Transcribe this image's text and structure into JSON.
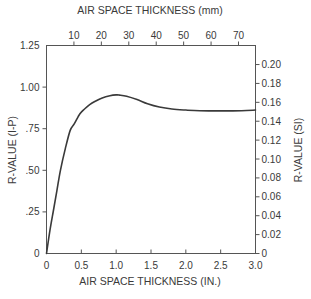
{
  "chart_data": {
    "type": "line",
    "title": "",
    "xlabel": "AIR SPACE THICKNESS  (IN.)",
    "xlabel_top": "AIR SPACE THICKNESS (mm)",
    "ylabel": "R-VALUE  (I-P)",
    "ylabel_right": "R-VALUE (SI)",
    "xlim": [
      0,
      3.0
    ],
    "ylim": [
      0,
      1.25
    ],
    "ylim_right": [
      0,
      0.22
    ],
    "x_ticks": [
      "0",
      "0.5",
      "1.0",
      "1.5",
      "2.0",
      "2.5",
      "3.0"
    ],
    "x_tick_values": [
      0,
      0.5,
      1.0,
      1.5,
      2.0,
      2.5,
      3.0
    ],
    "x_top_ticks": [
      "10",
      "20",
      "30",
      "40",
      "50",
      "60",
      "70"
    ],
    "x_top_tick_values_mm": [
      10,
      20,
      30,
      40,
      50,
      60,
      70
    ],
    "y_ticks": [
      "0",
      ".25",
      ".50",
      ".75",
      "1.00",
      "1.25"
    ],
    "y_tick_values": [
      0,
      0.25,
      0.5,
      0.75,
      1.0,
      1.25
    ],
    "y_right_ticks": [
      "0",
      "0.02",
      "0.04",
      "0.06",
      "0.08",
      "0.10",
      "0.12",
      "0.14",
      "0.16",
      "0.18",
      "0.20"
    ],
    "y_right_tick_values": [
      0,
      0.02,
      0.04,
      0.06,
      0.08,
      0.1,
      0.12,
      0.14,
      0.16,
      0.18,
      0.2
    ],
    "grid": false,
    "legend": null,
    "series": [
      {
        "name": "R-value vs air space thickness",
        "x": [
          0,
          0.05,
          0.1,
          0.15,
          0.2,
          0.27,
          0.34,
          0.4,
          0.48,
          0.55,
          0.62,
          0.7,
          0.8,
          0.91,
          1.0,
          1.05,
          1.15,
          1.3,
          1.45,
          1.62,
          1.8,
          2.0,
          2.2,
          2.5,
          2.8,
          3.0
        ],
        "y": [
          0,
          0.14,
          0.26,
          0.38,
          0.5,
          0.63,
          0.74,
          0.78,
          0.84,
          0.87,
          0.895,
          0.915,
          0.935,
          0.948,
          0.953,
          0.952,
          0.945,
          0.925,
          0.9,
          0.88,
          0.868,
          0.862,
          0.858,
          0.857,
          0.858,
          0.862
        ]
      }
    ]
  }
}
